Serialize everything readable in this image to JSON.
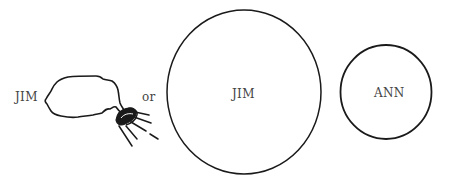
{
  "diagram": {
    "left_group": {
      "name_label": "JIM",
      "connector_label": "or"
    },
    "large_circle": {
      "label": "JIM",
      "center": [
        244,
        92
      ],
      "radius_x": 77,
      "radius_y": 82
    },
    "small_circle": {
      "label": "ANN",
      "center": [
        386,
        92
      ],
      "radius": 46
    },
    "colors": {
      "stroke": "#1a1a1a",
      "text": "#444444",
      "background": "#ffffff"
    }
  }
}
